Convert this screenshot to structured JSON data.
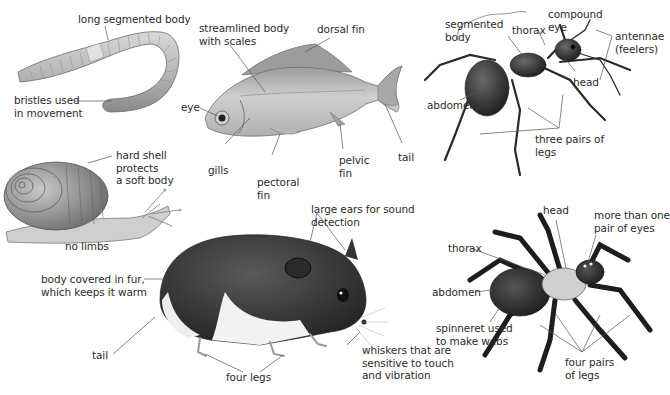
{
  "diagram": {
    "colors": {
      "background": "#ffffff",
      "label_text": "#2b2b2b",
      "leader_line": "#555555"
    },
    "animals": [
      {
        "name": "earthworm",
        "labels": [
          {
            "id": "worm_body",
            "text": "long segmented body"
          },
          {
            "id": "worm_bristles",
            "text": "bristles used\nin movement"
          }
        ]
      },
      {
        "name": "fish",
        "labels": [
          {
            "id": "fish_body",
            "text": "streamlined body\nwith scales"
          },
          {
            "id": "fish_dorsal",
            "text": "dorsal fin"
          },
          {
            "id": "fish_eye",
            "text": "eye"
          },
          {
            "id": "fish_gills",
            "text": "gills"
          },
          {
            "id": "fish_pectoral",
            "text": "pectoral\nfin"
          },
          {
            "id": "fish_pelvic",
            "text": "pelvic\nfin"
          },
          {
            "id": "fish_tail",
            "text": "tail"
          }
        ]
      },
      {
        "name": "ant",
        "labels": [
          {
            "id": "ant_segmented",
            "text": "segmented\nbody"
          },
          {
            "id": "ant_thorax",
            "text": "thorax"
          },
          {
            "id": "ant_eye",
            "text": "compound\neye"
          },
          {
            "id": "ant_antennae",
            "text": "antennae\n(feelers)"
          },
          {
            "id": "ant_head",
            "text": "head"
          },
          {
            "id": "ant_abdomen",
            "text": "abdomen"
          },
          {
            "id": "ant_legs",
            "text": "three pairs of\nlegs"
          }
        ]
      },
      {
        "name": "snail",
        "labels": [
          {
            "id": "snail_shell",
            "text": "hard shell\nprotects\na soft body"
          },
          {
            "id": "snail_limbs",
            "text": "no limbs"
          }
        ]
      },
      {
        "name": "hamster",
        "labels": [
          {
            "id": "ham_ears",
            "text": "large ears for sound\ndetection"
          },
          {
            "id": "ham_fur",
            "text": "body covered in fur,\nwhich keeps it warm"
          },
          {
            "id": "ham_tail",
            "text": "tail"
          },
          {
            "id": "ham_legs",
            "text": "four legs"
          },
          {
            "id": "ham_whiskers",
            "text": "whiskers that are\nsensitive to touch\nand vibration"
          }
        ]
      },
      {
        "name": "spider",
        "labels": [
          {
            "id": "sp_head",
            "text": "head"
          },
          {
            "id": "sp_eyes",
            "text": "more than one\npair of eyes"
          },
          {
            "id": "sp_thorax",
            "text": "thorax"
          },
          {
            "id": "sp_abdomen",
            "text": "abdomen"
          },
          {
            "id": "sp_spinneret",
            "text": "spinneret used\nto make webs"
          },
          {
            "id": "sp_legs",
            "text": "four pairs\nof legs"
          }
        ]
      }
    ]
  }
}
